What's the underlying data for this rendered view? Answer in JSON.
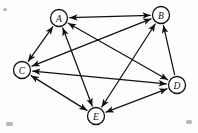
{
  "figure": {
    "background_color": "#fdfdfd",
    "ink_color": "#111111",
    "node_fill": "#ffffff",
    "width": 198,
    "height": 133
  },
  "graph": {
    "type": "directed-graph",
    "node_count": 5,
    "edge_count": 10,
    "nodes": [
      {
        "id": "A",
        "label": "A",
        "x": 59,
        "y": 18,
        "r": 8.5
      },
      {
        "id": "B",
        "label": "B",
        "x": 161,
        "y": 15,
        "r": 8.5
      },
      {
        "id": "C",
        "label": "C",
        "x": 22,
        "y": 70,
        "r": 8.5
      },
      {
        "id": "D",
        "label": "D",
        "x": 177,
        "y": 85,
        "r": 8.5
      },
      {
        "id": "E",
        "label": "E",
        "x": 96,
        "y": 116,
        "r": 8.5
      }
    ],
    "edges": [
      {
        "id": "AB",
        "from": "A",
        "to": "B",
        "direction": "both"
      },
      {
        "id": "AC",
        "from": "A",
        "to": "C",
        "direction": "both"
      },
      {
        "id": "AD",
        "from": "A",
        "to": "D",
        "direction": "both"
      },
      {
        "id": "AE",
        "from": "A",
        "to": "E",
        "direction": "both"
      },
      {
        "id": "BC",
        "from": "B",
        "to": "C",
        "direction": "both"
      },
      {
        "id": "BE",
        "from": "B",
        "to": "E",
        "direction": "both"
      },
      {
        "id": "BD",
        "from": "D",
        "to": "B",
        "direction": "forward"
      },
      {
        "id": "CD",
        "from": "C",
        "to": "D",
        "direction": "both"
      },
      {
        "id": "CE",
        "from": "C",
        "to": "E",
        "direction": "both"
      },
      {
        "id": "DE",
        "from": "D",
        "to": "E",
        "direction": "both"
      }
    ]
  },
  "specks": [
    {
      "x": 6,
      "y": 122,
      "w": 7,
      "h": 4
    },
    {
      "x": 186,
      "y": 120,
      "w": 6,
      "h": 4
    },
    {
      "x": 3,
      "y": 8,
      "w": 4,
      "h": 3
    }
  ]
}
